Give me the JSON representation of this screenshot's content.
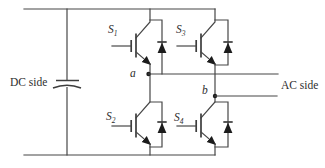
{
  "labels": {
    "dc_side": "DC side",
    "ac_side": "AC side",
    "node_a": "a",
    "node_b": "b"
  },
  "switches": [
    {
      "name": "S",
      "sub": "1"
    },
    {
      "name": "S",
      "sub": "2"
    },
    {
      "name": "S",
      "sub": "3"
    },
    {
      "name": "S",
      "sub": "4"
    }
  ],
  "colors": {
    "wire": "#474747",
    "symbol_fill": "#1c1c1c",
    "text": "#2e2e2e",
    "background": "#ffffff"
  }
}
